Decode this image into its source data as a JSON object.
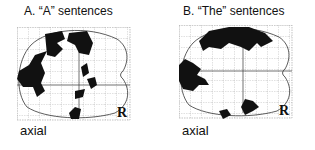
{
  "figure": {
    "panels": [
      {
        "id": "A",
        "title": "A. “A” sentences",
        "view_label": "axial",
        "orientation_marker": "R"
      },
      {
        "id": "B",
        "title": "B. “The” sentences",
        "view_label": "axial",
        "orientation_marker": "R"
      }
    ],
    "colors": {
      "activation": "#111111",
      "grid": "#9a9a9a",
      "outline": "#333333"
    }
  }
}
